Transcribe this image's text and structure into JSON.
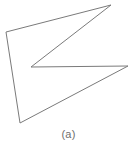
{
  "figure": {
    "caption": "(a)",
    "background_color": "#ffffff",
    "stroke_color": "#7a7a7a",
    "stroke_width": 1,
    "fill": "none",
    "caption_color": "#6e6e6e"
  },
  "chart_data": {
    "type": "scatter",
    "title": "",
    "subtitle": "",
    "xlabel": "",
    "ylabel": "",
    "annotations": [
      "(a)"
    ],
    "legend": [],
    "grid": false,
    "axis_visible": false,
    "xlim": [
      0,
      137
    ],
    "ylim": [
      0,
      131
    ],
    "shape_name": "concave-polygon",
    "shape_type": "closed-polyline",
    "vertex_count": 5,
    "vertex_labels": [
      "top-left",
      "top-right-apex",
      "notch-reflex",
      "right-arm-tip",
      "bottom-left"
    ],
    "x": [
      6,
      111,
      31,
      128,
      20
    ],
    "y": [
      32,
      5,
      67,
      66,
      123
    ],
    "points": [
      [
        6,
        32
      ],
      [
        111,
        5
      ],
      [
        31,
        67
      ],
      [
        128,
        66
      ],
      [
        20,
        123
      ]
    ],
    "polygon_path": "6,32 111,5 31,67 128,66 20,123",
    "edges": [
      {
        "name": "top-edge",
        "from": [
          6,
          32
        ],
        "to": [
          111,
          5
        ]
      },
      {
        "name": "upper-inner-diagonal",
        "from": [
          111,
          5
        ],
        "to": [
          31,
          67
        ]
      },
      {
        "name": "middle-horizontal-arm",
        "from": [
          31,
          67
        ],
        "to": [
          128,
          66
        ]
      },
      {
        "name": "lower-diagonal",
        "from": [
          128,
          66
        ],
        "to": [
          20,
          123
        ]
      },
      {
        "name": "left-edge",
        "from": [
          20,
          123
        ],
        "to": [
          6,
          32
        ]
      }
    ]
  }
}
